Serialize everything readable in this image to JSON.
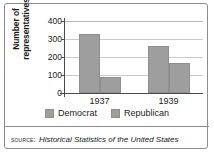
{
  "figure": {
    "source_label": "SOURCE:",
    "source_title": "Historical Statistics of the United States"
  },
  "chart_data": {
    "type": "bar",
    "title": "",
    "xlabel": "",
    "ylabel": "Number of representatives",
    "ylabel_line1": "Number of",
    "ylabel_line2": "representatives",
    "categories": [
      "1937",
      "1939"
    ],
    "series": [
      {
        "name": "Democrat",
        "values": [
          330,
          260
        ],
        "color": "#9e9e9e"
      },
      {
        "name": "Republican",
        "values": [
          90,
          165
        ],
        "color": "#9e9e9e"
      }
    ],
    "ylim": [
      0,
      400
    ],
    "yticks": [
      400,
      300,
      200,
      100,
      0
    ],
    "ytick_labels": [
      "400",
      "300",
      "200",
      "100",
      "0"
    ],
    "grid": true,
    "legend_position": "bottom"
  }
}
